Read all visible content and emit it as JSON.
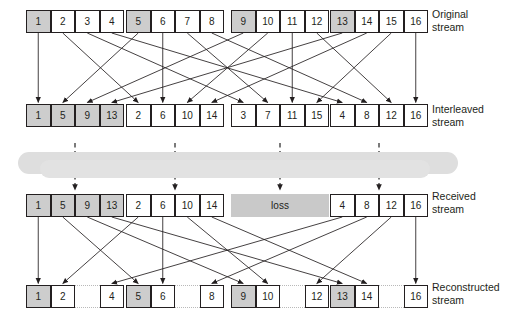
{
  "figure": {
    "type": "interleaving-diagram",
    "colors": {
      "cell_border": "#231f20",
      "cell_fill": "#ffffff",
      "cell_fill_highlight": "#cdcdcd",
      "loss_fill": "#c9c9c9",
      "channel_fill": "#dedede",
      "gap_border": "#b9b9b9",
      "arrow": "#231f20"
    }
  },
  "rows": {
    "original": {
      "label": "Original\nstream",
      "groups": [
        {
          "cells": [
            {
              "v": "1",
              "hl": true
            },
            {
              "v": "2",
              "hl": false
            },
            {
              "v": "3",
              "hl": false
            },
            {
              "v": "4",
              "hl": false
            }
          ]
        },
        {
          "cells": [
            {
              "v": "5",
              "hl": true
            },
            {
              "v": "6",
              "hl": false
            },
            {
              "v": "7",
              "hl": false
            },
            {
              "v": "8",
              "hl": false
            }
          ]
        },
        {
          "cells": [
            {
              "v": "9",
              "hl": true
            },
            {
              "v": "10",
              "hl": false
            },
            {
              "v": "11",
              "hl": false
            },
            {
              "v": "12",
              "hl": false
            }
          ]
        },
        {
          "cells": [
            {
              "v": "13",
              "hl": true
            },
            {
              "v": "14",
              "hl": false
            },
            {
              "v": "15",
              "hl": false
            },
            {
              "v": "16",
              "hl": false
            }
          ]
        }
      ]
    },
    "interleaved": {
      "label": "Interleaved\nstream",
      "groups": [
        {
          "cells": [
            {
              "v": "1",
              "hl": true
            },
            {
              "v": "5",
              "hl": true
            },
            {
              "v": "9",
              "hl": true
            },
            {
              "v": "13",
              "hl": true
            }
          ]
        },
        {
          "cells": [
            {
              "v": "2",
              "hl": false
            },
            {
              "v": "6",
              "hl": false
            },
            {
              "v": "10",
              "hl": false
            },
            {
              "v": "14",
              "hl": false
            }
          ]
        },
        {
          "cells": [
            {
              "v": "3",
              "hl": false
            },
            {
              "v": "7",
              "hl": false
            },
            {
              "v": "11",
              "hl": false
            },
            {
              "v": "15",
              "hl": false
            }
          ]
        },
        {
          "cells": [
            {
              "v": "4",
              "hl": false
            },
            {
              "v": "8",
              "hl": false
            },
            {
              "v": "12",
              "hl": false
            },
            {
              "v": "16",
              "hl": false
            }
          ]
        }
      ]
    },
    "received": {
      "label": "Received\nstream",
      "loss_label": "loss",
      "lost_group_index": 2,
      "groups": [
        {
          "cells": [
            {
              "v": "1",
              "hl": true
            },
            {
              "v": "5",
              "hl": true
            },
            {
              "v": "9",
              "hl": true
            },
            {
              "v": "13",
              "hl": true
            }
          ]
        },
        {
          "cells": [
            {
              "v": "2",
              "hl": false
            },
            {
              "v": "6",
              "hl": false
            },
            {
              "v": "10",
              "hl": false
            },
            {
              "v": "14",
              "hl": false
            }
          ]
        },
        {
          "lost": true
        },
        {
          "cells": [
            {
              "v": "4",
              "hl": false
            },
            {
              "v": "8",
              "hl": false
            },
            {
              "v": "12",
              "hl": false
            },
            {
              "v": "16",
              "hl": false
            }
          ]
        }
      ]
    },
    "reconstructed": {
      "label": "Reconstructed\nstream",
      "groups": [
        {
          "cells": [
            {
              "v": "1",
              "hl": true
            },
            {
              "v": "2",
              "hl": false
            },
            {
              "v": "",
              "gap": true
            },
            {
              "v": "4",
              "hl": false
            }
          ]
        },
        {
          "cells": [
            {
              "v": "5",
              "hl": true
            },
            {
              "v": "6",
              "hl": false
            },
            {
              "v": "",
              "gap": true
            },
            {
              "v": "8",
              "hl": false
            }
          ]
        },
        {
          "cells": [
            {
              "v": "9",
              "hl": true
            },
            {
              "v": "10",
              "hl": false
            },
            {
              "v": "",
              "gap": true
            },
            {
              "v": "12",
              "hl": false
            }
          ]
        },
        {
          "cells": [
            {
              "v": "13",
              "hl": true
            },
            {
              "v": "14",
              "hl": false
            },
            {
              "v": "",
              "gap": true
            },
            {
              "v": "16",
              "hl": false
            }
          ]
        }
      ]
    }
  }
}
